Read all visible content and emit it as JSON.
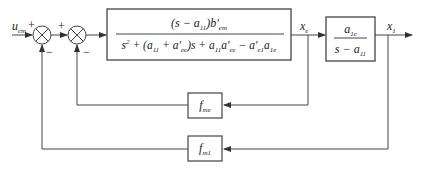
{
  "diagram": {
    "type": "control-block-diagram",
    "input": {
      "symbol": "u",
      "subscript": "cm"
    },
    "sum1": {
      "plus_sign": "+",
      "minus_sign": "−"
    },
    "sum2": {
      "plus_sign": "+",
      "minus_sign": "−"
    },
    "forward_block": {
      "numerator": "(s − a11) b′em",
      "denominator": "s² + (a11 + a′ee) s + a11 a′ee − a′e1 a1e"
    },
    "intermediate_signal": {
      "symbol": "x",
      "subscript": "e"
    },
    "second_block": {
      "numerator": "a1e",
      "denominator": "s − a11"
    },
    "output": {
      "symbol": "x",
      "subscript": "1"
    },
    "inner_feedback_block": {
      "symbol": "f",
      "subscript": "me"
    },
    "outer_feedback_block": {
      "symbol": "f",
      "subscript": "m1"
    },
    "colors": {
      "line": "#444444",
      "text": "#222222",
      "background": "#ffffff"
    }
  }
}
